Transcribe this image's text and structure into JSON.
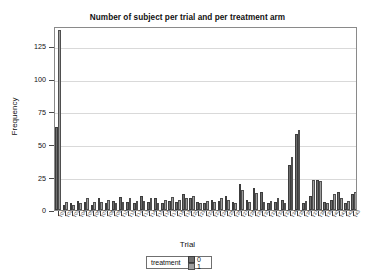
{
  "chart_data": {
    "type": "bar",
    "title": "Number of subject per trial and per treatment arm",
    "xlabel": "Trial",
    "ylabel": "Frequency",
    "ylim": [
      0,
      140
    ],
    "yticks": [
      0,
      25,
      50,
      75,
      100,
      125
    ],
    "grid": true,
    "legend_position": "bottom",
    "legend_title": "treatment",
    "categories": [
      "T01",
      "T02",
      "T03",
      "T04",
      "T05",
      "T06",
      "T07",
      "T08",
      "T09",
      "T10",
      "T11",
      "T12",
      "T13",
      "T14",
      "T15",
      "T16",
      "T17",
      "T18",
      "T19",
      "T20",
      "T21",
      "T22",
      "T23",
      "T24",
      "T25",
      "T26",
      "T27",
      "T28",
      "T29",
      "T30",
      "T31",
      "T32",
      "T33",
      "T34",
      "T35",
      "T36",
      "T37",
      "T38",
      "T39",
      "T40",
      "T41",
      "T42",
      "T43"
    ],
    "series": [
      {
        "name": "0",
        "color": "#6e6e6e",
        "values": [
          63,
          4,
          5,
          7,
          6,
          4,
          9,
          5,
          7,
          10,
          6,
          5,
          11,
          6,
          9,
          5,
          7,
          6,
          12,
          9,
          6,
          5,
          8,
          7,
          11,
          6,
          20,
          8,
          17,
          14,
          5,
          6,
          8,
          34,
          58,
          5,
          11,
          23,
          6,
          8,
          14,
          5,
          12
        ]
      },
      {
        "name": "1",
        "color": "#9e9e9e",
        "values": [
          137,
          6,
          4,
          5,
          9,
          6,
          6,
          8,
          5,
          6,
          9,
          7,
          7,
          9,
          5,
          8,
          10,
          8,
          9,
          11,
          5,
          7,
          6,
          9,
          8,
          5,
          15,
          6,
          13,
          6,
          7,
          9,
          5,
          40,
          61,
          7,
          23,
          22,
          5,
          12,
          9,
          7,
          14
        ]
      }
    ]
  }
}
